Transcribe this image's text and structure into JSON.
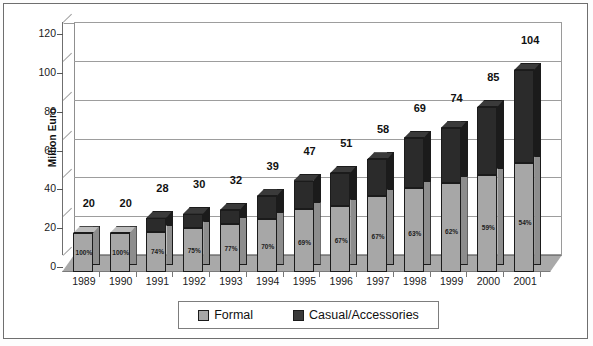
{
  "chart_data": {
    "type": "bar",
    "title": "",
    "subtitle": "",
    "xlabel": "",
    "ylabel": "Million Euro",
    "ylim": [
      0,
      120
    ],
    "yticks": [
      0,
      20,
      40,
      60,
      80,
      100,
      120
    ],
    "grid": true,
    "stacked": true,
    "legend_position": "bottom",
    "categories": [
      "1989",
      "1990",
      "1991",
      "1992",
      "1993",
      "1994",
      "1995",
      "1996",
      "1997",
      "1998",
      "1999",
      "2000",
      "2001"
    ],
    "totals": [
      20,
      20,
      28,
      30,
      32,
      39,
      47,
      51,
      58,
      69,
      74,
      85,
      104
    ],
    "formal_share_labels": [
      "100%",
      "100%",
      "74%",
      "75%",
      "77%",
      "70%",
      "69%",
      "67%",
      "67%",
      "63%",
      "62%",
      "59%",
      "54%"
    ],
    "series": [
      {
        "name": "Formal",
        "color": "#a7a7a7",
        "values": [
          20,
          20,
          20.7,
          22.5,
          24.6,
          27.3,
          32.4,
          34.2,
          38.9,
          43.5,
          45.9,
          50.2,
          56.2
        ]
      },
      {
        "name": "Casual/Accessories",
        "color": "#2b2b2b",
        "values": [
          0,
          0,
          7.3,
          7.5,
          7.4,
          11.7,
          14.6,
          16.8,
          19.1,
          25.5,
          28.1,
          34.8,
          47.8
        ]
      }
    ]
  },
  "legend": {
    "items": [
      {
        "label": "Formal",
        "swatch": "formal-swatch"
      },
      {
        "label": "Casual/Accessories",
        "swatch": "casual-swatch"
      }
    ]
  },
  "axis": {
    "y_title": "Million Euro",
    "y_ticks": [
      "0",
      "20",
      "40",
      "60",
      "80",
      "100",
      "120"
    ],
    "x_ticks": [
      "1989",
      "1990",
      "1991",
      "1992",
      "1993",
      "1994",
      "1995",
      "1996",
      "1997",
      "1998",
      "1999",
      "2000",
      "2001"
    ]
  }
}
